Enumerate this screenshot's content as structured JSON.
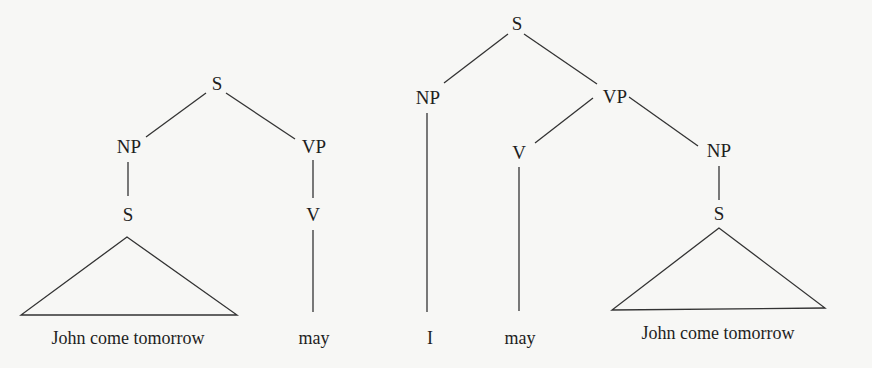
{
  "trees": [
    {
      "id": "left",
      "nodes": {
        "root": "S",
        "np": "NP",
        "vp": "VP",
        "np_s": "S",
        "vp_v": "V"
      },
      "leaves": {
        "subject_clause": "John come tomorrow",
        "verb": "may"
      }
    },
    {
      "id": "right",
      "nodes": {
        "root": "S",
        "np": "NP",
        "vp": "VP",
        "vp_v": "V",
        "vp_np": "NP",
        "vp_np_s": "S"
      },
      "leaves": {
        "subject": "I",
        "verb": "may",
        "object_clause": "John come tomorrow"
      }
    }
  ]
}
